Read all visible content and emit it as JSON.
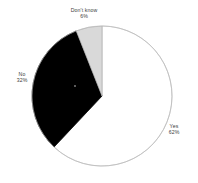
{
  "chart_data": {
    "type": "pie",
    "title": "",
    "subtitle": "",
    "xlabel": "",
    "ylabel": "",
    "legend": "none",
    "grid": false,
    "start_angle_deg": 0,
    "direction": "clockwise",
    "categories": [
      "Yes",
      "No",
      "Don't know"
    ],
    "values": [
      62,
      32,
      6
    ],
    "value_unit": "%",
    "slices": [
      {
        "label": "Yes",
        "value": 62,
        "percent_text": "62%",
        "color": "#ffffff",
        "stroke": "#b0b0b0",
        "start_deg": 0,
        "end_deg": 223.2
      },
      {
        "label": "No",
        "value": 32,
        "percent_text": "32%",
        "color": "#000000",
        "stroke": "#000000",
        "start_deg": 223.2,
        "end_deg": 338.4
      },
      {
        "label": "Don't know",
        "value": 6,
        "percent_text": "6%",
        "color": "#d9d9d9",
        "stroke": "#b0b0b0",
        "start_deg": 338.4,
        "end_deg": 360
      }
    ],
    "colors": {
      "yes": "#ffffff",
      "no": "#000000",
      "dont_know": "#d9d9d9",
      "outline": "#b0b0b0",
      "text": "#3d3d3d",
      "background": "#ffffff"
    },
    "geometry": {
      "center_x": 102,
      "center_y": 96,
      "radius": 70
    }
  },
  "labels": {
    "yes": {
      "name": "Yes",
      "percent": "62%"
    },
    "no": {
      "name": "No",
      "percent": "32%"
    },
    "dont_know": {
      "name": "Don't know",
      "percent": "6%"
    }
  }
}
